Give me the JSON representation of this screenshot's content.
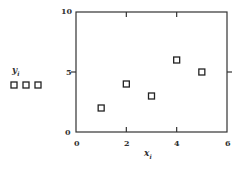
{
  "chart_data": {
    "type": "scatter",
    "title": "",
    "xlabel": "x",
    "xlabel_sub": "i",
    "ylabel": "y",
    "ylabel_sub": "i",
    "xlim": [
      0,
      6
    ],
    "ylim": [
      0,
      10
    ],
    "x_ticks": [
      "0",
      "2",
      "4",
      "6"
    ],
    "y_ticks": [
      "0",
      "5",
      "10"
    ],
    "grid": false,
    "marker": "open-square",
    "series": [
      {
        "name": "y_i",
        "x": [
          1,
          2,
          3,
          4,
          5
        ],
        "y": [
          2,
          4,
          3,
          6,
          5
        ]
      }
    ],
    "legend": {
      "position": "left",
      "symbol": "□□□",
      "label": "y",
      "label_sub": "i"
    }
  },
  "colors": {
    "axis": "#333333",
    "marker": "#222222",
    "background": "#ffffff"
  }
}
